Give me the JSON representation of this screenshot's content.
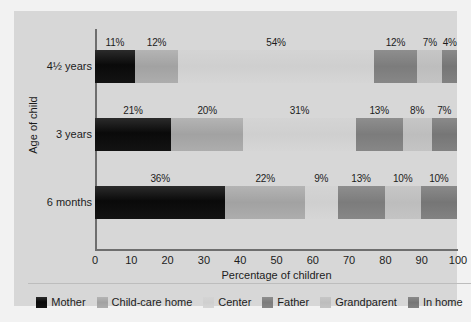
{
  "chart_data": {
    "type": "bar",
    "orientation": "horizontal",
    "stacked": true,
    "title": "",
    "xlabel": "Percentage of children",
    "ylabel": "Age of child",
    "xlim": [
      0,
      100
    ],
    "xticks": [
      0,
      10,
      20,
      30,
      40,
      50,
      60,
      70,
      80,
      90,
      100
    ],
    "xticklabels": [
      "0",
      "10",
      "20",
      "30",
      "40",
      "50",
      "60",
      "70",
      "80",
      "90",
      "100"
    ],
    "categories": [
      "4½ years",
      "3 years",
      "6 months"
    ],
    "grid": false,
    "legend_position": "bottom",
    "value_suffix": "%",
    "series": [
      {
        "name": "Mother",
        "color": "#0f0f0f",
        "values": [
          11,
          21,
          36
        ]
      },
      {
        "name": "Child-care home",
        "color": "#a6a6a6",
        "values": [
          12,
          20,
          22
        ]
      },
      {
        "name": "Center",
        "color": "#d2d2d2",
        "values": [
          54,
          31,
          9
        ]
      },
      {
        "name": "Father",
        "color": "#808080",
        "values": [
          12,
          13,
          13
        ]
      },
      {
        "name": "Grandparent",
        "color": "#c0c0c0",
        "values": [
          7,
          8,
          10
        ]
      },
      {
        "name": "In home",
        "color": "#7a7a7a",
        "values": [
          4,
          7,
          10
        ]
      }
    ],
    "rows": [
      {
        "category": "4½ years",
        "segments": [
          {
            "name": "Mother",
            "value": 11,
            "label": "11%",
            "class": "c-mother"
          },
          {
            "name": "Child-care home",
            "value": 12,
            "label": "12%",
            "class": "c-childcare"
          },
          {
            "name": "Center",
            "value": 54,
            "label": "54%",
            "class": "c-center"
          },
          {
            "name": "Father",
            "value": 12,
            "label": "12%",
            "class": "c-father"
          },
          {
            "name": "Grandparent",
            "value": 7,
            "label": "7%",
            "class": "c-grandparent"
          },
          {
            "name": "In home",
            "value": 4,
            "label": "4%",
            "class": "c-inhome"
          }
        ]
      },
      {
        "category": "3 years",
        "segments": [
          {
            "name": "Mother",
            "value": 21,
            "label": "21%",
            "class": "c-mother"
          },
          {
            "name": "Child-care home",
            "value": 20,
            "label": "20%",
            "class": "c-childcare"
          },
          {
            "name": "Center",
            "value": 31,
            "label": "31%",
            "class": "c-center"
          },
          {
            "name": "Father",
            "value": 13,
            "label": "13%",
            "class": "c-father"
          },
          {
            "name": "Grandparent",
            "value": 8,
            "label": "8%",
            "class": "c-grandparent"
          },
          {
            "name": "In home",
            "value": 7,
            "label": "7%",
            "class": "c-inhome"
          }
        ]
      },
      {
        "category": "6 months",
        "segments": [
          {
            "name": "Mother",
            "value": 36,
            "label": "36%",
            "class": "c-mother"
          },
          {
            "name": "Child-care home",
            "value": 22,
            "label": "22%",
            "class": "c-childcare"
          },
          {
            "name": "Center",
            "value": 9,
            "label": "9%",
            "class": "c-center"
          },
          {
            "name": "Father",
            "value": 13,
            "label": "13%",
            "class": "c-father"
          },
          {
            "name": "Grandparent",
            "value": 10,
            "label": "10%",
            "class": "c-grandparent"
          },
          {
            "name": "In home",
            "value": 10,
            "label": "10%",
            "class": "c-inhome"
          }
        ]
      }
    ]
  },
  "axes": {
    "x_title": "Percentage of children",
    "y_title": "Age of child",
    "y_ticks": [
      "4½ years",
      "3 years",
      "6 months"
    ],
    "x_ticks": [
      "0",
      "10",
      "20",
      "30",
      "40",
      "50",
      "60",
      "70",
      "80",
      "90",
      "100"
    ]
  },
  "legend": {
    "items": [
      {
        "label": "Mother",
        "class": "c-mother"
      },
      {
        "label": "Child-care home",
        "class": "c-childcare"
      },
      {
        "label": "Center",
        "class": "c-center"
      },
      {
        "label": "Father",
        "class": "c-father"
      },
      {
        "label": "Grandparent",
        "class": "c-grandparent"
      },
      {
        "label": "In home",
        "class": "c-inhome"
      }
    ]
  },
  "colors": {
    "panel_background": "#d7d7d7",
    "figure_background": "#f2f2f2",
    "axis_line": "#6e6e6e",
    "text": "#1c1c1c",
    "divider": "#bdbdbd"
  }
}
